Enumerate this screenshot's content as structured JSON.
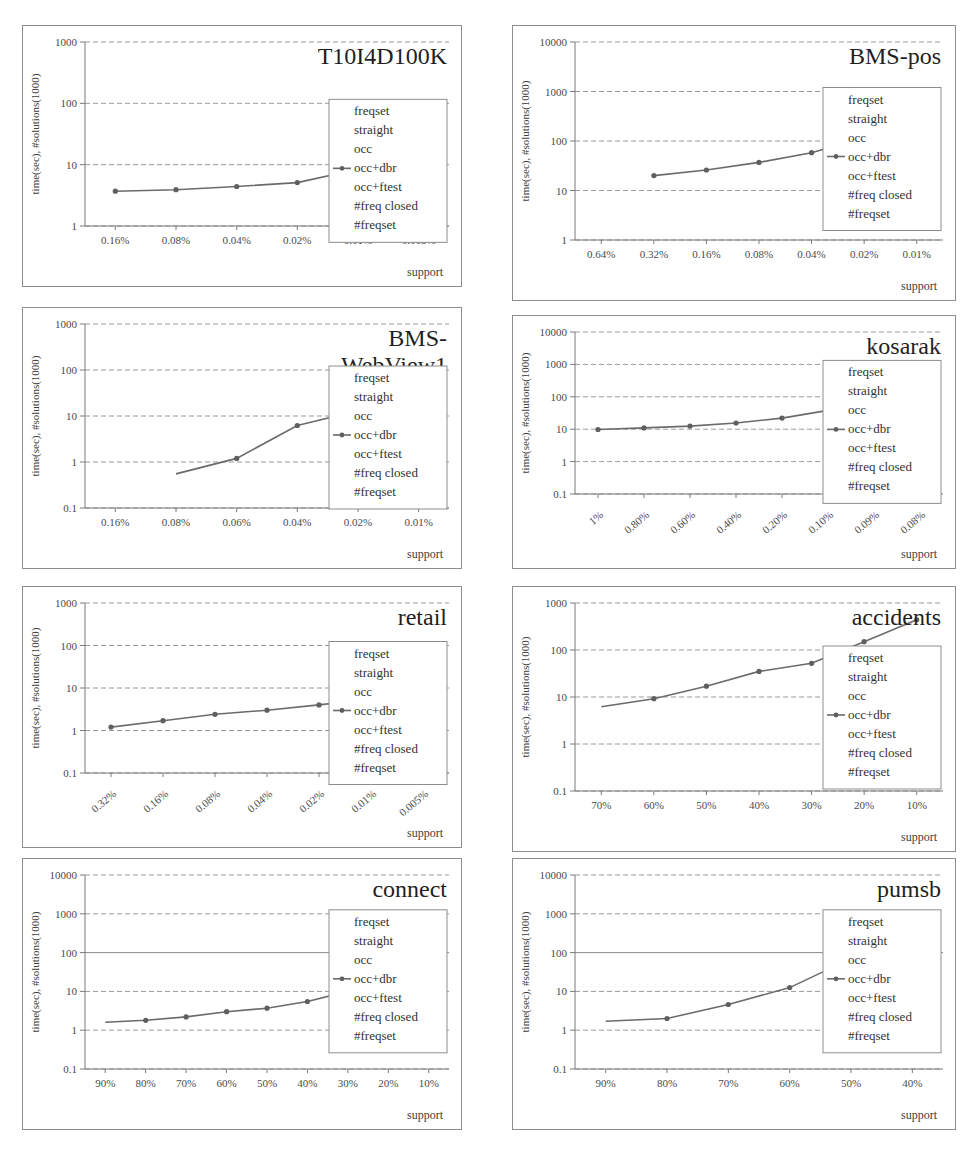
{
  "figure": {
    "panel_count": 8,
    "legend_entries": [
      "freqset",
      "straight",
      "occ",
      "occ+dbr",
      "occ+ftest",
      "#freq closed",
      "#freqset"
    ],
    "legend_marker_index": 3,
    "xlabel": "support",
    "ylabel": "time(sec), #solutions(1000)",
    "line_color": "#6b6b6b",
    "marker_color": "#5f5f5f",
    "grid_color": "#9a9a9a",
    "border_color": "#8d8d8d"
  },
  "chart_data": [
    {
      "type": "line",
      "title": "T10I4D100K",
      "xlabel": "support",
      "ylabel": "time(sec), #solutions(1000)",
      "categories": [
        "0.16%",
        "0.08%",
        "0.04%",
        "0.02%",
        "0.01%",
        "0.005%"
      ],
      "yticks": [
        1,
        10,
        100,
        1000
      ],
      "ylim": [
        1,
        1000
      ],
      "yscale": "log",
      "grid": true,
      "legend_position": "right",
      "series": [
        {
          "name": "occ+dbr",
          "values": [
            3.7,
            3.9,
            4.4,
            5.1,
            8.4,
            15.0
          ]
        }
      ]
    },
    {
      "type": "line",
      "title": "BMS-pos",
      "xlabel": "support",
      "ylabel": "time(sec), #solutions(1000)",
      "categories": [
        "0.64%",
        "0.32%",
        "0.16%",
        "0.08%",
        "0.04%",
        "0.02%",
        "0.01%"
      ],
      "yticks": [
        1,
        10,
        100,
        1000,
        10000
      ],
      "ylim": [
        1,
        10000
      ],
      "yscale": "log",
      "grid": true,
      "legend_position": "right",
      "series": [
        {
          "name": "occ+dbr",
          "values": [
            null,
            20,
            26,
            37,
            58,
            118,
            325
          ]
        }
      ]
    },
    {
      "type": "line",
      "title": "BMS-WebView1",
      "xlabel": "support",
      "ylabel": "time(sec), #solutions(1000)",
      "categories": [
        "0.16%",
        "0.08%",
        "0.06%",
        "0.04%",
        "0.02%",
        "0.01%"
      ],
      "yticks": [
        0.1,
        1,
        10,
        100,
        1000
      ],
      "ylim": [
        0.1,
        1000
      ],
      "yscale": "log",
      "grid": true,
      "legend_position": "right",
      "series": [
        {
          "name": "occ+dbr",
          "values": [
            null,
            0.55,
            1.2,
            6.2,
            13.0,
            43.0
          ]
        }
      ]
    },
    {
      "type": "line",
      "title": "kosarak",
      "xlabel": "support",
      "ylabel": "time(sec), #solutions(1000)",
      "categories": [
        "1%",
        "0.80%",
        "0.60%",
        "0.40%",
        "0.20%",
        "0.10%",
        "0.09%",
        "0.08%"
      ],
      "yticks": [
        0.1,
        1,
        10,
        100,
        1000,
        10000
      ],
      "ylim": [
        0.1,
        10000
      ],
      "yscale": "log",
      "grid": true,
      "legend_position": "right",
      "series": [
        {
          "name": "occ+dbr",
          "values": [
            9.8,
            11.0,
            12.5,
            15.5,
            22.0,
            38.0,
            50.0,
            250.0
          ]
        }
      ]
    },
    {
      "type": "line",
      "title": "retail",
      "xlabel": "support",
      "ylabel": "time(sec), #solutions(1000)",
      "categories": [
        "0.32%",
        "0.16%",
        "0.08%",
        "0.04%",
        "0.02%",
        "0.01%",
        "0.005%"
      ],
      "yticks": [
        0.1,
        1,
        10,
        100,
        1000
      ],
      "ylim": [
        0.1,
        1000
      ],
      "yscale": "log",
      "grid": true,
      "legend_position": "right",
      "series": [
        {
          "name": "occ+dbr",
          "values": [
            1.2,
            1.7,
            2.4,
            3.0,
            4.0,
            5.5,
            9.5
          ]
        }
      ]
    },
    {
      "type": "line",
      "title": "accidents",
      "xlabel": "support",
      "ylabel": "time(sec), #solutions(1000)",
      "categories": [
        "70%",
        "60%",
        "50%",
        "40%",
        "30%",
        "20%",
        "10%"
      ],
      "yticks": [
        0.1,
        1,
        10,
        100,
        1000
      ],
      "ylim": [
        0.1,
        1000
      ],
      "yscale": "log",
      "grid": true,
      "legend_position": "right",
      "series": [
        {
          "name": "occ+dbr",
          "values": [
            6.2,
            9.2,
            17.0,
            35.0,
            52.0,
            150.0,
            440.0
          ]
        }
      ]
    },
    {
      "type": "line",
      "title": "connect",
      "xlabel": "support",
      "ylabel": "time(sec), #solutions(1000)",
      "categories": [
        "90%",
        "80%",
        "70%",
        "60%",
        "50%",
        "40%",
        "30%",
        "20%",
        "10%"
      ],
      "yticks": [
        0.1,
        1,
        10,
        100,
        1000,
        10000
      ],
      "ylim": [
        0.1,
        10000
      ],
      "yscale": "log",
      "grid": true,
      "legend_position": "right",
      "series": [
        {
          "name": "occ+dbr",
          "values": [
            1.6,
            1.8,
            2.2,
            3.0,
            3.7,
            5.5,
            10.0,
            30.0,
            100.0
          ]
        }
      ]
    },
    {
      "type": "line",
      "title": "pumsb",
      "xlabel": "support",
      "ylabel": "time(sec), #solutions(1000)",
      "categories": [
        "90%",
        "80%",
        "70%",
        "60%",
        "50%",
        "40%"
      ],
      "yticks": [
        0.1,
        1,
        10,
        100,
        1000,
        10000
      ],
      "ylim": [
        0.1,
        10000
      ],
      "yscale": "log",
      "grid": true,
      "legend_position": "right",
      "series": [
        {
          "name": "occ+dbr",
          "values": [
            1.7,
            2.0,
            4.6,
            12.5,
            70.0,
            400.0
          ]
        }
      ]
    }
  ],
  "panel_layout": [
    {
      "x": 22,
      "y": 25,
      "w": 440,
      "h": 262,
      "chart": 0,
      "title_lines": [
        "T10I4D100K"
      ],
      "rotate_x": false,
      "title_size": 24
    },
    {
      "x": 512,
      "y": 25,
      "w": 444,
      "h": 276,
      "chart": 1,
      "title_lines": [
        "BMS-pos"
      ],
      "rotate_x": false,
      "title_size": 26
    },
    {
      "x": 22,
      "y": 307,
      "w": 440,
      "h": 262,
      "chart": 2,
      "title_lines": [
        "BMS-",
        "WebView1"
      ],
      "rotate_x": false,
      "title_size": 24
    },
    {
      "x": 512,
      "y": 315,
      "w": 444,
      "h": 254,
      "chart": 3,
      "title_lines": [
        "kosarak"
      ],
      "rotate_x": true,
      "title_size": 26
    },
    {
      "x": 22,
      "y": 586,
      "w": 440,
      "h": 262,
      "chart": 4,
      "title_lines": [
        "retail"
      ],
      "rotate_x": true,
      "title_size": 26
    },
    {
      "x": 512,
      "y": 586,
      "w": 444,
      "h": 266,
      "chart": 5,
      "title_lines": [
        "accidents"
      ],
      "rotate_x": false,
      "title_size": 26
    },
    {
      "x": 22,
      "y": 858,
      "w": 440,
      "h": 272,
      "chart": 6,
      "title_lines": [
        "connect"
      ],
      "rotate_x": false,
      "title_size": 26
    },
    {
      "x": 512,
      "y": 858,
      "w": 444,
      "h": 272,
      "chart": 7,
      "title_lines": [
        "pumsb"
      ],
      "rotate_x": false,
      "title_size": 26
    }
  ]
}
